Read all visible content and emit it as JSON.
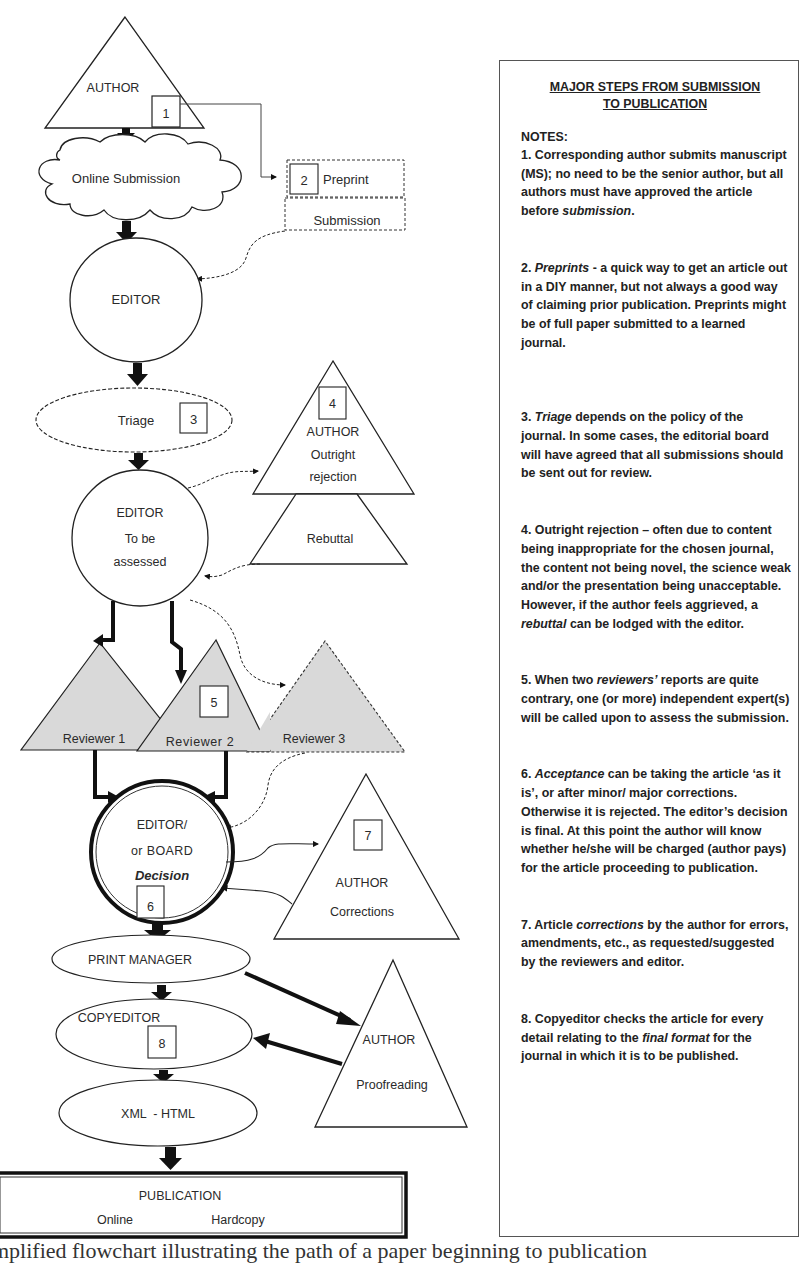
{
  "flowchart": {
    "author_top": {
      "label": "AUTHOR",
      "step": "1"
    },
    "online_submission": {
      "label": "Online Submission"
    },
    "preprint": {
      "step": "2",
      "label": "Preprint",
      "sub_label": "Submission"
    },
    "editor": {
      "label": "EDITOR"
    },
    "triage": {
      "label": "Triage",
      "step": "3"
    },
    "author_rejection": {
      "step": "4",
      "line1": "AUTHOR",
      "line2": "Outright",
      "line3": "rejection",
      "rebuttal": "Rebuttal"
    },
    "editor_assess": {
      "line1": "EDITOR",
      "line2": "To be",
      "line3": "assessed"
    },
    "reviewers": [
      {
        "label": "Reviewer 1"
      },
      {
        "label": "Reviewer 2",
        "step": "5"
      },
      {
        "label": "Reviewer 3"
      }
    ],
    "decision": {
      "line1": "EDITOR/",
      "line2": "or BOARD",
      "line3": "Decision",
      "step": "6"
    },
    "author_corrections": {
      "step": "7",
      "line1": "AUTHOR",
      "line2": "Corrections"
    },
    "print_manager": {
      "label": "PRINT MANAGER"
    },
    "copyeditor": {
      "label": "COPYEDITOR",
      "step": "8"
    },
    "author_proofreading": {
      "line1": "AUTHOR",
      "line2": "Proofreading"
    },
    "xml_html": {
      "label": "XML  - HTML"
    },
    "publication": {
      "title": "PUBLICATION",
      "online": "Online",
      "hardcopy": "Hardcopy"
    }
  },
  "notes": {
    "title_line1": "MAJOR STEPS FROM SUBMISSION",
    "title_line2": "TO PUBLICATION",
    "label": "NOTES:",
    "items": [
      {
        "pre": "1. Corresponding author submits manuscript (MS); no need to be the senior author, but all authors must have approved the article before ",
        "em": "submission",
        "post": "."
      },
      {
        "pre": "2. ",
        "em": "Preprints",
        "post": " - a quick way to get an article out in a DIY manner, but not always a good way of claiming prior publication. Preprints might be of full paper submitted to a learned journal."
      },
      {
        "pre": "3. ",
        "em": "Triage",
        "post": " depends on the policy of the journal. In some cases, the editorial board will have agreed that all submissions should be sent out for review."
      },
      {
        "pre": "4. Outright rejection – often due to content being inappropriate for the chosen journal, the content not being novel, the science weak and/or the presentation being unacceptable. However, if the author feels aggrieved, a ",
        "em": "rebuttal",
        "post": " can be lodged with the editor."
      },
      {
        "pre": "5. When two ",
        "em": "reviewers’",
        "post": " reports are quite contrary, one (or more) independent expert(s) will be called upon to assess the submission."
      },
      {
        "pre": "6. ",
        "em": "Acceptance",
        "post": " can be taking the article ‘as it is’, or after minor/ major corrections. Otherwise it is rejected. The editor’s decision is final. At this point the author will know whether he/she will be charged (author pays) for the article proceeding to publication."
      },
      {
        "pre": "7. Article ",
        "em": "corrections",
        "post": " by the author for errors, amendments, etc., as requested/suggested by the reviewers and editor."
      },
      {
        "pre": "8. Copyeditor checks the article for every detail relating to the ",
        "em": "final format",
        "post": " for the journal in which it is to be published."
      }
    ]
  },
  "caption": "mplified flowchart illustrating the path of a paper beginning to publication"
}
